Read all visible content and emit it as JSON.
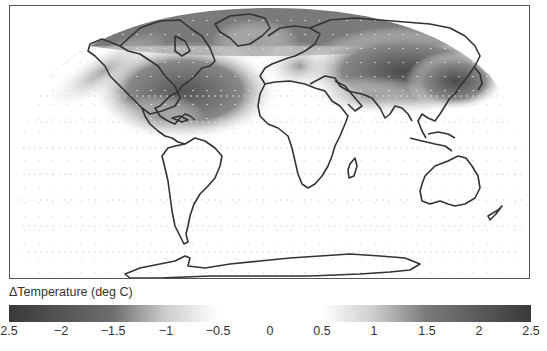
{
  "map": {
    "projection": "robinson-like global",
    "grayscale": true,
    "regions_shaded": [
      {
        "name": "north-america-arctic",
        "level": "warming 1.5-2.5"
      },
      {
        "name": "greenland",
        "level": "warming 1-2"
      },
      {
        "name": "siberia-east-asia",
        "level": "warming 1.5-2.5"
      },
      {
        "name": "europe-north",
        "level": "warming 1-1.5"
      },
      {
        "name": "north-pacific-arc",
        "level": "warming 1-2"
      }
    ]
  },
  "colorbar": {
    "title": "ΔTemperature (deg C)",
    "ticks": [
      "2.5",
      "−2",
      "−1.5",
      "−1",
      "−0.5",
      "0",
      "0.5",
      "1",
      "1.5",
      "2",
      "2.5"
    ],
    "min": -2.5,
    "max": 2.5,
    "colors": {
      "extreme": "#3a3a3a",
      "mid": "#9a9a9a",
      "center": "#ffffff"
    }
  }
}
